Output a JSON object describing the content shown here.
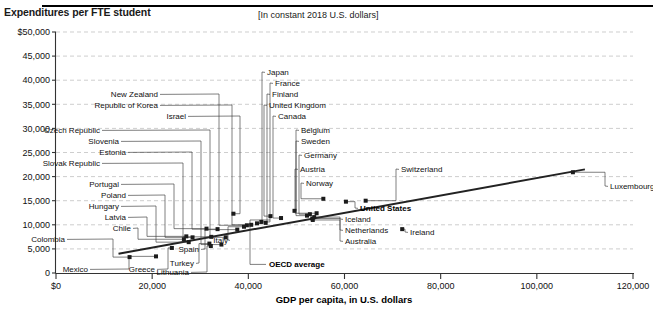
{
  "header": {
    "title": "Expenditures per FTE student",
    "units_note": "[In constant 2018 U.S. dollars]"
  },
  "chart_data": {
    "type": "scatter",
    "title": "Expenditures per FTE student",
    "subtitle": "[In constant 2018 U.S. dollars]",
    "xlabel": "GDP per capita, in U.S. dollars",
    "ylabel": "Expenditures per FTE student",
    "xlim": [
      0,
      120000
    ],
    "ylim": [
      0,
      50000
    ],
    "grid": true,
    "legend_position": "none",
    "xticks": [
      "$0",
      "20,000",
      "40,000",
      "60,000",
      "80,000",
      "100,000",
      "120,000"
    ],
    "xtick_values": [
      0,
      20000,
      40000,
      60000,
      80000,
      100000,
      120000
    ],
    "yticks": [
      "0",
      "5,000",
      "10,000",
      "15,000",
      "20,000",
      "25,000",
      "30,000",
      "35,000",
      "40,000",
      "45,000",
      "$50,000"
    ],
    "ytick_values": [
      0,
      5000,
      10000,
      15000,
      20000,
      25000,
      30000,
      35000,
      40000,
      45000,
      50000
    ],
    "trendline": {
      "label": "OECD average",
      "x": [
        13000,
        110000
      ],
      "y": [
        4000,
        21500
      ]
    },
    "points": [
      {
        "name": "Colombia",
        "x": 15300,
        "y": 3300
      },
      {
        "name": "Mexico",
        "x": 20800,
        "y": 3450
      },
      {
        "name": "Greece",
        "x": 24100,
        "y": 5200
      },
      {
        "name": "Chile",
        "x": 26600,
        "y": 7000
      },
      {
        "name": "Latvia",
        "x": 27100,
        "y": 7600
      },
      {
        "name": "Hungary",
        "x": 27600,
        "y": 6400
      },
      {
        "name": "Poland",
        "x": 28400,
        "y": 7400
      },
      {
        "name": "Portugal",
        "x": 31300,
        "y": 9200
      },
      {
        "name": "Turkey",
        "x": 31900,
        "y": 6100
      },
      {
        "name": "Lithuania",
        "x": 32200,
        "y": 5600
      },
      {
        "name": "Slovak Republic",
        "x": 32300,
        "y": 7500
      },
      {
        "name": "Estonia",
        "x": 33600,
        "y": 9100
      },
      {
        "name": "Slovenia",
        "x": 34400,
        "y": 5900
      },
      {
        "name": "Czech Republic",
        "x": 35300,
        "y": 7400
      },
      {
        "name": "Israel",
        "x": 36900,
        "y": 12300
      },
      {
        "name": "Spain",
        "x": 37700,
        "y": 9000
      },
      {
        "name": "Italy",
        "x": 39100,
        "y": 9600
      },
      {
        "name": "New Zealand",
        "x": 39700,
        "y": 9900
      },
      {
        "name": "Republic of Korea",
        "x": 40600,
        "y": 10000
      },
      {
        "name": "Japan",
        "x": 41800,
        "y": 10300
      },
      {
        "name": "France",
        "x": 42700,
        "y": 10600
      },
      {
        "name": "Finland",
        "x": 43600,
        "y": 10400
      },
      {
        "name": "United Kingdom",
        "x": 44600,
        "y": 11800
      },
      {
        "name": "Canada",
        "x": 46800,
        "y": 11400
      },
      {
        "name": "Belgium",
        "x": 49600,
        "y": 12900
      },
      {
        "name": "Sweden",
        "x": 52200,
        "y": 11900
      },
      {
        "name": "Germany",
        "x": 52800,
        "y": 12200
      },
      {
        "name": "Iceland",
        "x": 53300,
        "y": 11300
      },
      {
        "name": "Netherlands",
        "x": 53700,
        "y": 11600
      },
      {
        "name": "Australia",
        "x": 53400,
        "y": 11000
      },
      {
        "name": "Austria",
        "x": 54200,
        "y": 12400
      },
      {
        "name": "Norway",
        "x": 55600,
        "y": 15400
      },
      {
        "name": "United States",
        "x": 60300,
        "y": 14800
      },
      {
        "name": "Switzerland",
        "x": 64400,
        "y": 15000
      },
      {
        "name": "Ireland",
        "x": 72000,
        "y": 9100
      },
      {
        "name": "Luxembourg",
        "x": 107500,
        "y": 20900
      }
    ],
    "annotations": [
      {
        "label": "Japan",
        "kind": "callout"
      },
      {
        "label": "France",
        "kind": "callout"
      },
      {
        "label": "Finland",
        "kind": "callout"
      },
      {
        "label": "United Kingdom",
        "kind": "callout"
      },
      {
        "label": "Canada",
        "kind": "callout"
      },
      {
        "label": "New Zealand",
        "kind": "callout"
      },
      {
        "label": "Republic of Korea",
        "kind": "callout"
      },
      {
        "label": "Israel",
        "kind": "callout"
      },
      {
        "label": "Czech Republic",
        "kind": "callout"
      },
      {
        "label": "Slovenia",
        "kind": "callout"
      },
      {
        "label": "Estonia",
        "kind": "callout"
      },
      {
        "label": "Slovak Republic",
        "kind": "callout"
      },
      {
        "label": "Portugal",
        "kind": "callout"
      },
      {
        "label": "Poland",
        "kind": "callout"
      },
      {
        "label": "Hungary",
        "kind": "callout"
      },
      {
        "label": "Latvia",
        "kind": "callout"
      },
      {
        "label": "Chile",
        "kind": "callout"
      },
      {
        "label": "Colombia",
        "kind": "callout"
      },
      {
        "label": "Mexico",
        "kind": "callout"
      },
      {
        "label": "Greece",
        "kind": "callout"
      },
      {
        "label": "Turkey",
        "kind": "callout"
      },
      {
        "label": "Lithuania",
        "kind": "callout"
      },
      {
        "label": "Spain",
        "kind": "callout"
      },
      {
        "label": "Italy",
        "kind": "callout"
      },
      {
        "label": "Belgium",
        "kind": "callout"
      },
      {
        "label": "Sweden",
        "kind": "callout"
      },
      {
        "label": "Germany",
        "kind": "callout"
      },
      {
        "label": "Austria",
        "kind": "callout"
      },
      {
        "label": "Norway",
        "kind": "callout"
      },
      {
        "label": "Switzerland",
        "kind": "callout"
      },
      {
        "label": "Iceland",
        "kind": "callout"
      },
      {
        "label": "Netherlands",
        "kind": "callout"
      },
      {
        "label": "Australia",
        "kind": "callout"
      },
      {
        "label": "United States",
        "kind": "callout-bold"
      },
      {
        "label": "Ireland",
        "kind": "callout"
      },
      {
        "label": "Luxembourg",
        "kind": "callout"
      },
      {
        "label": "OECD average",
        "kind": "callout-bold"
      }
    ]
  },
  "labels": {
    "japan": "Japan",
    "france": "France",
    "finland": "Finland",
    "united_kingdom": "United Kingdom",
    "canada": "Canada",
    "new_zealand": "New Zealand",
    "republic_of_korea": "Republic of Korea",
    "israel": "Israel",
    "czech_republic": "Czech Republic",
    "slovenia": "Slovenia",
    "estonia": "Estonia",
    "slovak_republic": "Slovak Republic",
    "portugal": "Portugal",
    "poland": "Poland",
    "hungary": "Hungary",
    "latvia": "Latvia",
    "chile": "Chile",
    "colombia": "Colombia",
    "mexico": "Mexico",
    "greece": "Greece",
    "turkey": "Turkey",
    "lithuania": "Lithuania",
    "spain": "Spain",
    "italy": "Italy",
    "belgium": "Belgium",
    "sweden": "Sweden",
    "germany": "Germany",
    "austria": "Austria",
    "norway": "Norway",
    "switzerland": "Switzerland",
    "iceland": "Iceland",
    "netherlands": "Netherlands",
    "australia": "Australia",
    "united_states": "United States",
    "ireland": "Ireland",
    "luxembourg": "Luxembourg",
    "oecd_average": "OECD average"
  },
  "axis": {
    "x_title": "GDP per capita, in U.S. dollars",
    "y_ticks": [
      "$50,000",
      "45,000",
      "40,000",
      "35,000",
      "30,000",
      "25,000",
      "20,000",
      "15,000",
      "10,000",
      "5,000",
      "0"
    ],
    "x_ticks": [
      "$0",
      "20,000",
      "40,000",
      "60,000",
      "80,000",
      "100,000",
      "120,000"
    ]
  }
}
